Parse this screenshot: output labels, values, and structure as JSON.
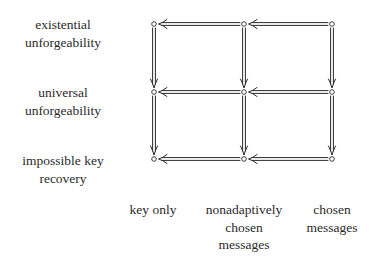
{
  "diagram": {
    "type": "implication-lattice",
    "rows": [
      {
        "label_lines": [
          "existential",
          "unforgeability"
        ]
      },
      {
        "label_lines": [
          "universal",
          "unforgeability"
        ]
      },
      {
        "label_lines": [
          "impossible key",
          "recovery"
        ]
      }
    ],
    "columns": [
      {
        "label_lines": [
          "key only"
        ]
      },
      {
        "label_lines": [
          "nonadaptively",
          "chosen",
          "messages"
        ]
      },
      {
        "label_lines": [
          "chosen",
          "messages"
        ]
      }
    ],
    "node_symbol": "small-open-circle",
    "horizontal_arrows": "double-line, pointing left (right column implies left column)",
    "vertical_arrows": "double-line, pointing down (upper row implies lower row)",
    "colors": {
      "ink": "#2a2a2a",
      "background": "#ffffff"
    }
  }
}
